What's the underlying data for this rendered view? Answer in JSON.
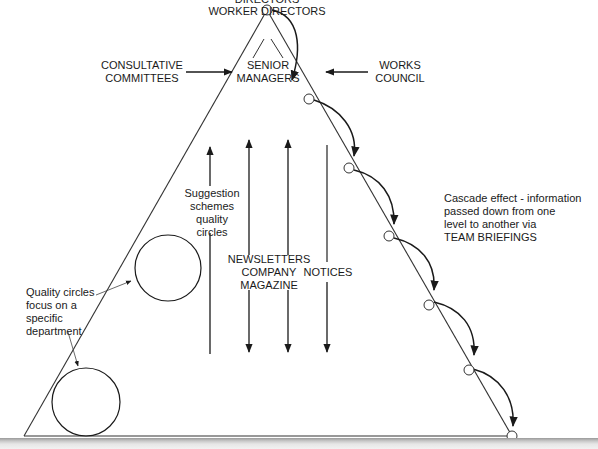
{
  "diagram": {
    "top": {
      "directors": "DIRECTORS",
      "worker_directors": "WORKER DIRECTORS"
    },
    "senior_managers": [
      "SENIOR",
      "MANAGERS"
    ],
    "consultative_committees": [
      "CONSULTATIVE",
      "COMMITTEES"
    ],
    "works_council": [
      "WORKS",
      "COUNCIL"
    ],
    "suggestion_schemes": [
      "Suggestion",
      "schemes",
      "quality",
      "circles"
    ],
    "newsletters": [
      "NEWSLETTERS",
      "COMPANY",
      "MAGAZINE"
    ],
    "notices": "NOTICES",
    "quality_circles_note": [
      "Quality circles",
      "focus on a",
      "specific",
      "department"
    ],
    "cascade_note": [
      "Cascade effect - information",
      "passed down from one",
      "level to another via",
      "TEAM BRIEFINGS"
    ],
    "colors": {
      "line": "#333333",
      "text": "#1a1a1a",
      "background": "#ffffff"
    }
  }
}
